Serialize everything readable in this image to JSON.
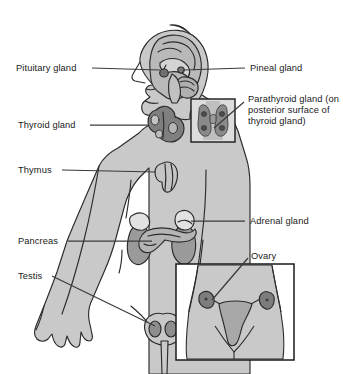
{
  "diagram": {
    "type": "anatomical-illustration",
    "colors": {
      "background": "#ffffff",
      "body_fill": "#c9c9c9",
      "outline": "#2b2b2b",
      "organ_dark": "#8e8e8e",
      "organ_mid": "#a8a8a8",
      "organ_light": "#dedede",
      "brain_fill": "#bdbdbd",
      "text": "#1a1a1a",
      "leader_line": "#3a3a3a",
      "inset_border": "#1a1a1a"
    },
    "labels": [
      {
        "id": "pituitary-gland",
        "text": "Pituitary gland",
        "side": "left",
        "x": 16,
        "y": 63,
        "multiline": false
      },
      {
        "id": "thyroid-gland",
        "text": "Thyroid gland",
        "side": "left",
        "x": 18,
        "y": 120,
        "multiline": false
      },
      {
        "id": "thymus",
        "text": "Thymus",
        "side": "left",
        "x": 18,
        "y": 165,
        "multiline": false
      },
      {
        "id": "pancreas",
        "text": "Pancreas",
        "side": "left",
        "x": 18,
        "y": 236,
        "multiline": false
      },
      {
        "id": "testis",
        "text": "Testis",
        "side": "left",
        "x": 18,
        "y": 271,
        "multiline": false
      },
      {
        "id": "pineal-gland",
        "text": "Pineal gland",
        "side": "right",
        "x": 250,
        "y": 63,
        "multiline": false
      },
      {
        "id": "parathyroid-gland",
        "text": "Parathyroid gland (on posterior surface of thyroid gland)",
        "side": "right",
        "x": 248,
        "y": 94,
        "multiline": true
      },
      {
        "id": "adrenal-gland",
        "text": "Adrenal gland",
        "side": "right",
        "x": 250,
        "y": 216,
        "multiline": false
      },
      {
        "id": "ovary",
        "text": "Ovary",
        "side": "right",
        "x": 251,
        "y": 251,
        "multiline": false
      }
    ],
    "insets": [
      {
        "id": "parathyroid-inset",
        "caption_ref": "parathyroid-gland",
        "x": 191,
        "y": 99,
        "w": 44,
        "h": 43
      },
      {
        "id": "ovary-inset",
        "caption_ref": "ovary",
        "x": 176,
        "y": 264,
        "w": 118,
        "h": 96
      }
    ],
    "structures": [
      "brain",
      "pituitary-gland",
      "pineal-gland",
      "thyroid-gland",
      "parathyroid-gland",
      "thymus",
      "adrenal-gland",
      "pancreas",
      "kidney",
      "testis",
      "ovary",
      "uterus"
    ]
  }
}
